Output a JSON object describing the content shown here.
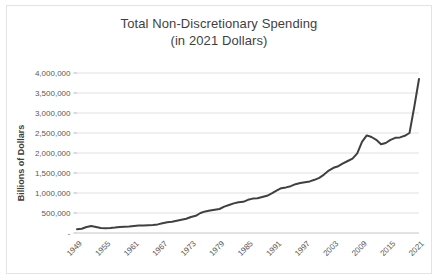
{
  "chart_data": {
    "type": "line",
    "title": "Total Non-Discretionary Spending",
    "subtitle": "(in 2021 Dollars)",
    "xlabel": "",
    "ylabel": "Billions of Dollars",
    "ylim": [
      0,
      4000000
    ],
    "ytick_labels": [
      "4,000,000",
      "3,500,000",
      "3,000,000",
      "2,500,000",
      "2,000,000",
      "1,500,000",
      "1,000,000",
      "500,000",
      "-"
    ],
    "ytick_values": [
      4000000,
      3500000,
      3000000,
      2500000,
      2000000,
      1500000,
      1000000,
      500000,
      0
    ],
    "xtick_labels": [
      "1949",
      "1955",
      "1961",
      "1967",
      "1973",
      "1979",
      "1985",
      "1991",
      "1997",
      "2003",
      "2009",
      "2015",
      "2021"
    ],
    "xtick_values": [
      1949,
      1955,
      1961,
      1967,
      1973,
      1979,
      1985,
      1991,
      1997,
      2003,
      2009,
      2015,
      2021
    ],
    "xlim": [
      1949,
      2021
    ],
    "grid": true,
    "legend": "none",
    "line_color": "#404040",
    "line_width": 2,
    "x": [
      1949,
      1950,
      1951,
      1952,
      1953,
      1954,
      1955,
      1956,
      1957,
      1958,
      1959,
      1960,
      1961,
      1962,
      1963,
      1964,
      1965,
      1966,
      1967,
      1968,
      1969,
      1970,
      1971,
      1972,
      1973,
      1974,
      1975,
      1976,
      1977,
      1978,
      1979,
      1980,
      1981,
      1982,
      1983,
      1984,
      1985,
      1986,
      1987,
      1988,
      1989,
      1990,
      1991,
      1992,
      1993,
      1994,
      1995,
      1996,
      1997,
      1998,
      1999,
      2000,
      2001,
      2002,
      2003,
      2004,
      2005,
      2006,
      2007,
      2008,
      2009,
      2010,
      2011,
      2012,
      2013,
      2014,
      2015,
      2016,
      2017,
      2018,
      2019,
      2020,
      2021
    ],
    "values": [
      95000,
      105000,
      150000,
      175000,
      150000,
      125000,
      120000,
      125000,
      135000,
      150000,
      155000,
      160000,
      175000,
      185000,
      190000,
      195000,
      200000,
      215000,
      245000,
      270000,
      280000,
      305000,
      330000,
      355000,
      400000,
      430000,
      500000,
      540000,
      560000,
      580000,
      600000,
      660000,
      700000,
      740000,
      770000,
      780000,
      830000,
      860000,
      870000,
      900000,
      930000,
      990000,
      1060000,
      1120000,
      1140000,
      1170000,
      1220000,
      1250000,
      1270000,
      1290000,
      1330000,
      1380000,
      1460000,
      1560000,
      1630000,
      1670000,
      1740000,
      1800000,
      1860000,
      1990000,
      2280000,
      2440000,
      2400000,
      2330000,
      2220000,
      2250000,
      2330000,
      2380000,
      2390000,
      2430000,
      2500000,
      3150000,
      3850000
    ]
  }
}
